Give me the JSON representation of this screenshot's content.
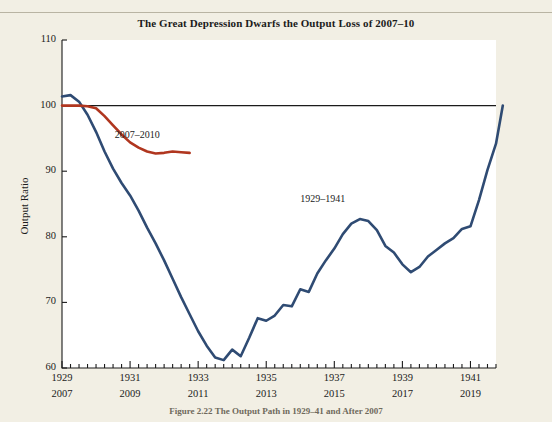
{
  "figure": {
    "title": "The Great Depression Dwarfs the Output Loss of 2007–10",
    "caption": "Figure 2.22 The Output Path in 1929–41 and After 2007",
    "background_color": "#f2efe4",
    "plot_background_color": "#ffffff"
  },
  "chart_data": {
    "type": "line",
    "title": "The Great Depression Dwarfs the Output Loss of 2007–10",
    "xlabel": "",
    "ylabel": "Output Ratio",
    "ylim": [
      60,
      110
    ],
    "yticks": [
      60,
      70,
      80,
      90,
      100,
      110
    ],
    "ytick_labels": [
      "60",
      "70",
      "80",
      "90",
      "100",
      "110"
    ],
    "xlim": [
      1929.0,
      1941.75
    ],
    "xticks_major": [
      1929,
      1931,
      1933,
      1935,
      1937,
      1939,
      1941
    ],
    "xtick_labels_top": [
      "1929",
      "1931",
      "1933",
      "1935",
      "1937",
      "1939",
      "1941"
    ],
    "xtick_labels_bottom": [
      "2007",
      "2009",
      "2011",
      "2013",
      "2015",
      "2017",
      "2019"
    ],
    "xtick_minor_step": 0.25,
    "grid": false,
    "legend_position": "inline-annotations",
    "reference_line": {
      "y": 100,
      "color": "#1b1b1b",
      "label": ""
    },
    "annotations": [
      {
        "text": "2007–2010",
        "x": 1930.55,
        "y": 95.4,
        "color": "#1b1b1b"
      },
      {
        "text": "1929–1941",
        "x": 1936.0,
        "y": 85.6,
        "color": "#1b1b1b"
      }
    ],
    "series": [
      {
        "name": "1929–1941",
        "color": "#2f4b73",
        "width": 2.6,
        "x": [
          1929.0,
          1929.25,
          1929.5,
          1929.75,
          1930.0,
          1930.25,
          1930.5,
          1930.75,
          1931.0,
          1931.25,
          1931.5,
          1931.75,
          1932.0,
          1932.25,
          1932.5,
          1932.75,
          1933.0,
          1933.25,
          1933.5,
          1933.75,
          1934.0,
          1934.25,
          1934.5,
          1934.75,
          1935.0,
          1935.25,
          1935.5,
          1935.75,
          1936.0,
          1936.25,
          1936.5,
          1936.75,
          1937.0,
          1937.25,
          1937.5,
          1937.75,
          1938.0,
          1938.25,
          1938.5,
          1938.75,
          1939.0,
          1939.25,
          1939.5,
          1939.75,
          1940.0,
          1940.25,
          1940.5,
          1940.75,
          1941.0,
          1941.25,
          1941.5,
          1941.75
        ],
        "y": [
          101.4,
          101.6,
          100.6,
          98.6,
          96.0,
          93.0,
          90.4,
          88.2,
          86.3,
          84.0,
          81.4,
          79.0,
          76.4,
          73.6,
          70.8,
          68.2,
          65.6,
          63.4,
          61.6,
          61.2,
          62.8,
          61.8,
          64.6,
          67.6,
          67.2,
          68.0,
          69.6,
          69.4,
          72.0,
          71.6,
          74.4,
          76.4,
          78.2,
          80.4,
          82.0,
          82.7,
          82.4,
          81.0,
          78.6,
          77.6,
          75.8,
          74.6,
          75.4,
          77.0,
          78.0,
          79.0,
          79.8,
          81.2,
          81.6,
          85.6,
          90.2,
          94.2
        ]
      },
      {
        "name": "2007–2010",
        "color": "#b0361f",
        "width": 2.6,
        "x": [
          1929.0,
          1929.25,
          1929.5,
          1929.75,
          1930.0,
          1930.25,
          1930.5,
          1930.75,
          1931.0,
          1931.25,
          1931.5,
          1931.75,
          1932.0,
          1932.25,
          1932.5,
          1932.75
        ],
        "y": [
          100.0,
          100.0,
          100.0,
          99.9,
          99.6,
          98.4,
          97.0,
          95.6,
          94.4,
          93.6,
          93.0,
          92.7,
          92.8,
          93.0,
          92.9,
          92.8
        ]
      }
    ],
    "series_end_extension": {
      "name": "1929–1941",
      "x_end": 1941.95,
      "y_end": 100.0
    }
  },
  "axes": {
    "y_axis_title": "Output Ratio",
    "tick_color": "#1b1b1b",
    "frame_color": "#1b1b1b"
  }
}
